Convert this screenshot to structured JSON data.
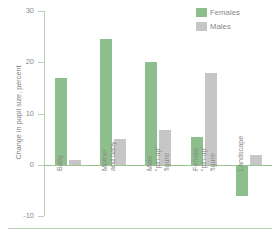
{
  "chart_data": {
    "type": "bar",
    "title": "",
    "subtitle": "",
    "xlabel": "",
    "ylabel": "Change in pupil size, percent",
    "ylim": [
      -10,
      30
    ],
    "yticks": [
      30,
      20,
      10,
      0,
      -10
    ],
    "ytick_labels": [
      "30",
      "20",
      "10",
      "0",
      "-10"
    ],
    "grid": false,
    "legend_position": "top-right",
    "categories": [
      "Baby",
      "Mother\nand baby",
      "Male\n“pin-up”\nfigure",
      "Female\n“pin-up”\nfigure",
      "Landscape"
    ],
    "series": [
      {
        "name": "Females",
        "color": "#8cbf8c",
        "values": [
          17,
          24.5,
          20,
          5.5,
          -6
        ]
      },
      {
        "name": "Males",
        "color": "#c6c6c6",
        "values": [
          1,
          5,
          6.8,
          18,
          2
        ]
      }
    ]
  },
  "legend": {
    "items": [
      {
        "label": "Females",
        "color": "#8cbf8c"
      },
      {
        "label": "Males",
        "color": "#c6c6c6"
      }
    ]
  },
  "axis": {
    "line_color": "#b9cfb6",
    "zero_line_color": "#9cc296"
  }
}
